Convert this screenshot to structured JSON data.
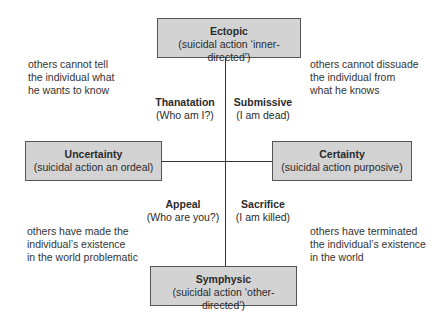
{
  "boxes": {
    "top": {
      "title": "Ectopic",
      "subtitle": "(suicidal action ‘inner-directed’)"
    },
    "left": {
      "title": "Uncertainty",
      "subtitle": "(suicidal action an ordeal)"
    },
    "right": {
      "title": "Certainty",
      "subtitle": "(suicidal action purposive)"
    },
    "bottom": {
      "title": "Symphysic",
      "subtitle": "(suicidal action ‘other-directed’)"
    }
  },
  "quadrants": {
    "top_left": {
      "title": "Thanatation",
      "subtitle": "(Who am I?)"
    },
    "top_right": {
      "title": "Submissive",
      "subtitle": "(I am dead)"
    },
    "bottom_left": {
      "title": "Appeal",
      "subtitle": "(Who are you?)"
    },
    "bottom_right": {
      "title": "Sacrifice",
      "subtitle": "(I am killed)"
    }
  },
  "notes": {
    "top_left": "others cannot tell\nthe individual what\nhe wants to know",
    "top_right": "others cannot dissuade\nthe individual from\nwhat he knows",
    "bottom_left": "others have made the\nindividual’s existence\nin the world problematic",
    "bottom_right": "others have terminated\nthe individual’s existence\nin the world"
  },
  "colors": {
    "box_fill": "#d3d3d3",
    "box_border": "#555555",
    "line": "#333333"
  }
}
